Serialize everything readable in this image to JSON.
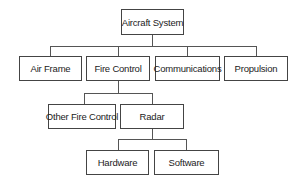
{
  "diagram": {
    "type": "hierarchy",
    "root": {
      "label": "Aircraft System",
      "children": [
        {
          "label": "Air Frame"
        },
        {
          "label": "Fire Control",
          "children": [
            {
              "label": "Other Fire Control"
            },
            {
              "label": "Radar",
              "children": [
                {
                  "label": "Hardware"
                },
                {
                  "label": "Software"
                }
              ]
            }
          ]
        },
        {
          "label": "Communications"
        },
        {
          "label": "Propulsion"
        }
      ]
    },
    "nodes": {
      "aircraft_system": "Aircraft System",
      "air_frame": "Air Frame",
      "fire_control": "Fire Control",
      "communications": "Communications",
      "propulsion": "Propulsion",
      "other_fire_control": "Other Fire Control",
      "radar": "Radar",
      "hardware": "Hardware",
      "software": "Software"
    }
  }
}
